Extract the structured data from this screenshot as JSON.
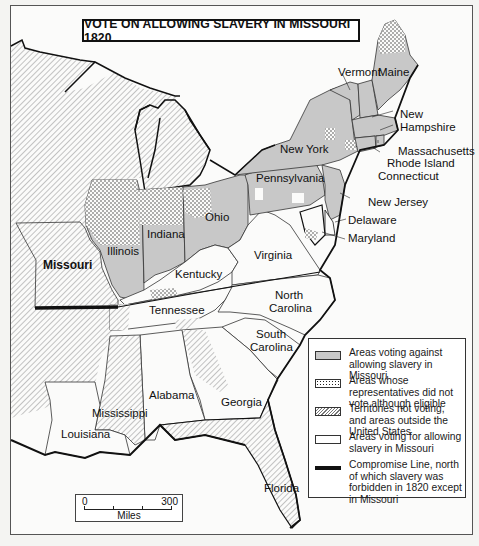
{
  "map": {
    "title": "VOTE ON ALLOWING SLAVERY IN MISSOURI 1820",
    "colors": {
      "against": "#c8c8c8",
      "did_not_vote": "dotted",
      "territories": "hatched",
      "for": "#ffffff",
      "compromise_line": "#111111"
    },
    "state_labels": {
      "maine": "Maine",
      "vermont": "Vermont",
      "new_hampshire_1": "New",
      "new_hampshire_2": "Hampshire",
      "massachusetts": "Massachusetts",
      "rhode_island": "Rhode Island",
      "connecticut": "Connecticut",
      "new_york": "New York",
      "pennsylvania": "Pennsylvania",
      "new_jersey": "New Jersey",
      "delaware": "Delaware",
      "maryland": "Maryland",
      "ohio": "Ohio",
      "indiana": "Indiana",
      "illinois": "Illinois",
      "missouri": "Missouri",
      "kentucky": "Kentucky",
      "virginia": "Virginia",
      "tennessee": "Tennessee",
      "north_carolina_1": "North",
      "north_carolina_2": "Carolina",
      "south_carolina_1": "South",
      "south_carolina_2": "Carolina",
      "alabama": "Alabama",
      "georgia": "Georgia",
      "mississippi": "Mississippi",
      "louisiana": "Louisiana",
      "florida": "Florida"
    },
    "legend": [
      {
        "swatch": "gray",
        "label": "Areas voting against allowing slavery in Missouri"
      },
      {
        "swatch": "dots",
        "label": "Areas whose representatives did not vote although eligible"
      },
      {
        "swatch": "hatch",
        "label": "Territories not voting, and areas outside the United States"
      },
      {
        "swatch": "white",
        "label": "Areas voting for allowing slavery in Missouri"
      },
      {
        "swatch": "line",
        "label": "Compromise Line, north of which slavery was forbidden in 1820 except in Missouri"
      }
    ],
    "scale": {
      "start": "0",
      "end": "300",
      "unit": "Miles"
    }
  }
}
